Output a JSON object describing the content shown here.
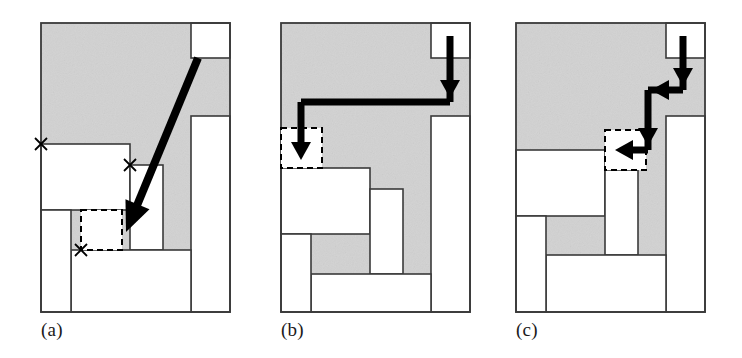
{
  "figure": {
    "width": 742,
    "height": 358,
    "background_color": "#ffffff",
    "gray_fill_color": "#d2d2d2",
    "white_fill_color": "#ffffff",
    "outline_color": "#3a3a3a",
    "arrow_color": "#000000",
    "dashed_color": "#000000",
    "panel_count": 3
  },
  "panels": [
    {
      "id": "a",
      "caption": "(a)",
      "origin_x": 30,
      "frame": {
        "x": 11,
        "y": 23,
        "w": 189,
        "h": 289
      },
      "annotation": "Single long diagonal arrow from the top-right notch down to the dashed target box; three small x corner markers.",
      "gray_regions": [
        {
          "name": "main-gray-region",
          "x": 11,
          "y": 23,
          "w": 189,
          "h": 289
        }
      ],
      "white_rects": [
        {
          "name": "top-right-block",
          "x": 161,
          "y": 23,
          "w": 39,
          "h": 35
        },
        {
          "name": "right-tall-column",
          "x": 161,
          "y": 116,
          "w": 39,
          "h": 196
        },
        {
          "name": "left-upper-block",
          "x": 11,
          "y": 144,
          "w": 89,
          "h": 66
        },
        {
          "name": "mid-vertical-block",
          "x": 100,
          "y": 165,
          "w": 33,
          "h": 85
        },
        {
          "name": "bottom-wide-block",
          "x": 41,
          "y": 250,
          "w": 120,
          "h": 62
        },
        {
          "name": "bottom-left-block",
          "x": 11,
          "y": 210,
          "w": 30,
          "h": 102
        }
      ],
      "dashed_boxes": [
        {
          "name": "target-dashed-box",
          "x": 51,
          "y": 210,
          "w": 41,
          "h": 40
        }
      ],
      "x_markers": [
        {
          "name": "x-marker-left",
          "x": 11,
          "y": 144
        },
        {
          "name": "x-marker-mid",
          "x": 100,
          "y": 165
        },
        {
          "name": "x-marker-bottom",
          "x": 51,
          "y": 250
        }
      ],
      "arrows": [
        {
          "name": "diagonal-placement-arrow",
          "type": "straight",
          "points": [
            [
              168,
              58
            ],
            [
              96,
              232
            ]
          ],
          "head": "end"
        }
      ]
    },
    {
      "id": "b",
      "caption": "(b)",
      "origin_x": 270,
      "frame": {
        "x": 11,
        "y": 23,
        "w": 189,
        "h": 289
      },
      "annotation": "Two-segment arrow: down from the top-right notch then long left traverse ending with a down arrow into the dashed box at the far left.",
      "gray_regions": [
        {
          "name": "main-gray-region",
          "x": 11,
          "y": 23,
          "w": 189,
          "h": 289
        }
      ],
      "white_rects": [
        {
          "name": "top-right-block",
          "x": 161,
          "y": 23,
          "w": 39,
          "h": 35
        },
        {
          "name": "right-tall-column",
          "x": 161,
          "y": 116,
          "w": 39,
          "h": 196
        },
        {
          "name": "left-upper-block",
          "x": 11,
          "y": 168,
          "w": 89,
          "h": 66
        },
        {
          "name": "mid-vertical-block",
          "x": 100,
          "y": 189,
          "w": 33,
          "h": 85
        },
        {
          "name": "bottom-wide-block",
          "x": 41,
          "y": 274,
          "w": 120,
          "h": 38
        },
        {
          "name": "bottom-left-block",
          "x": 11,
          "y": 234,
          "w": 30,
          "h": 78
        }
      ],
      "dashed_boxes": [
        {
          "name": "target-dashed-box",
          "x": 11,
          "y": 128,
          "w": 41,
          "h": 40
        }
      ],
      "x_markers": [],
      "arrows": [
        {
          "name": "drop-and-slide-arrow",
          "type": "polyline",
          "points": [
            [
              180,
              36
            ],
            [
              180,
              102
            ],
            [
              31,
              102
            ],
            [
              31,
              160
            ]
          ],
          "head": "end",
          "intermediate_heads": [
            [
              180,
              98
            ]
          ]
        }
      ]
    },
    {
      "id": "c",
      "caption": "(c)",
      "origin_x": 505,
      "frame": {
        "x": 11,
        "y": 23,
        "w": 189,
        "h": 289
      },
      "annotation": "Zig-zag staircase arrow: down, left, down, left into the dashed box sitting on the middle ledge.",
      "gray_regions": [
        {
          "name": "main-gray-region",
          "x": 11,
          "y": 23,
          "w": 189,
          "h": 289
        }
      ],
      "white_rects": [
        {
          "name": "top-right-block",
          "x": 161,
          "y": 23,
          "w": 39,
          "h": 35
        },
        {
          "name": "right-tall-column",
          "x": 161,
          "y": 116,
          "w": 39,
          "h": 196
        },
        {
          "name": "left-upper-block",
          "x": 11,
          "y": 150,
          "w": 89,
          "h": 66
        },
        {
          "name": "mid-vertical-block",
          "x": 100,
          "y": 170,
          "w": 33,
          "h": 85
        },
        {
          "name": "bottom-wide-block",
          "x": 41,
          "y": 255,
          "w": 120,
          "h": 57
        },
        {
          "name": "bottom-left-block",
          "x": 11,
          "y": 216,
          "w": 30,
          "h": 96
        }
      ],
      "dashed_boxes": [
        {
          "name": "target-dashed-box",
          "x": 100,
          "y": 130,
          "w": 41,
          "h": 40
        }
      ],
      "x_markers": [],
      "arrows": [
        {
          "name": "staircase-placement-arrow",
          "type": "polyline",
          "points": [
            [
              178,
              36
            ],
            [
              178,
              90
            ],
            [
              143,
              90
            ],
            [
              143,
              150
            ],
            [
              110,
              150
            ]
          ],
          "head": "end",
          "intermediate_heads": [
            [
              178,
              86
            ],
            [
              146,
              90
            ],
            [
              143,
              146
            ]
          ]
        }
      ]
    }
  ]
}
